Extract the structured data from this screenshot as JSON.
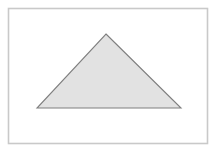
{
  "figure": {
    "name": "triangle-figure",
    "width": 217,
    "height": 153,
    "page_background": "#ffffff",
    "frame": {
      "name": "figure-border",
      "x": 8.5,
      "y": 8.5,
      "width": 199,
      "height": 135,
      "stroke_color": "#c9c9c9",
      "stroke_width": 1.6,
      "fill_color": "#ffffff"
    },
    "shapes": [
      {
        "name": "triangle",
        "kind": "polygon",
        "label": "isosceles triangle",
        "points": "106,34 181,108 37,108",
        "vertices": [
          {
            "name": "apex",
            "x": 106,
            "y": 34
          },
          {
            "name": "base-right",
            "x": 181,
            "y": 108
          },
          {
            "name": "base-left",
            "x": 37,
            "y": 108
          }
        ],
        "fill_color": "#e2e2e2",
        "stroke_color": "#7f7f7f",
        "stroke_width": 1.1
      }
    ]
  }
}
